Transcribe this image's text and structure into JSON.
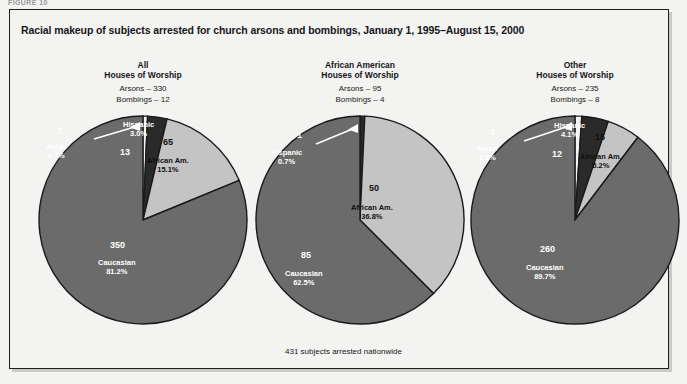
{
  "figure_label": "FIGURE 10",
  "title": "Racial makeup of subjects arrested for church arsons and bombings, January 1, 1995–August 15, 2000",
  "footnote": "431 subjects arrested nationwide",
  "colors": {
    "caucasian": "#6b6b6b",
    "african_american": "#c4c4c4",
    "hispanic": "#2a2a2a",
    "asian": "#f3f3f1",
    "outline": "#1a1a1a",
    "frame": "#1d1d1d",
    "text": "#17171a"
  },
  "chart_data": [
    {
      "type": "pie",
      "title": "All",
      "subtitle": "Houses of Worship",
      "stat_arsons": "Arsons – 330",
      "stat_bombings": "Bombings – 12",
      "categories": [
        "Caucasian",
        "African Am.",
        "Hispanic",
        "Asian"
      ],
      "values": [
        350,
        65,
        13,
        3
      ],
      "percents": [
        "81.2%",
        "15.1%",
        "3.0%",
        "0.7%"
      ],
      "labels": [
        {
          "num": "350",
          "name": "Caucasian",
          "pct": "81.2%"
        },
        {
          "num": "65",
          "name": "African Am.",
          "pct": "15.1%"
        },
        {
          "num": "13",
          "name": "Hispanic",
          "pct": "3.0%"
        },
        {
          "num": "3",
          "name": "Asian",
          "pct": "0.7%"
        }
      ]
    },
    {
      "type": "pie",
      "title": "African American",
      "subtitle": "Houses of Worship",
      "stat_arsons": "Arsons – 95",
      "stat_bombings": "Bombings – 4",
      "categories": [
        "Caucasian",
        "African Am.",
        "Hispanic"
      ],
      "values": [
        85,
        50,
        1
      ],
      "percents": [
        "62.5%",
        "36.8%",
        "0.7%"
      ],
      "labels": [
        {
          "num": "85",
          "name": "Caucasian",
          "pct": "62.5%"
        },
        {
          "num": "50",
          "name": "African Am.",
          "pct": "36.8%"
        },
        {
          "num": "1",
          "name": "Hispanic",
          "pct": "0.7%"
        }
      ]
    },
    {
      "type": "pie",
      "title": "Other",
      "subtitle": "Houses of Worship",
      "stat_arsons": "Arsons – 235",
      "stat_bombings": "Bombings – 8",
      "categories": [
        "Caucasian",
        "African Am.",
        "Hispanic",
        "Asian"
      ],
      "values": [
        260,
        15,
        12,
        3
      ],
      "percents": [
        "89.7%",
        "5.2%",
        "4.1%",
        "1.0%"
      ],
      "labels": [
        {
          "num": "260",
          "name": "Caucasian",
          "pct": "89.7%"
        },
        {
          "num": "15",
          "name": "African Am.",
          "pct": "5.2%"
        },
        {
          "num": "12",
          "name": "Hispanic",
          "pct": "4.1%"
        },
        {
          "num": "3",
          "name": "Asian",
          "pct": "1.0%"
        }
      ]
    }
  ]
}
